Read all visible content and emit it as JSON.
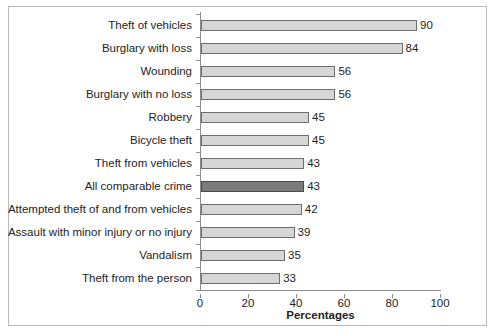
{
  "chart_data": {
    "type": "bar",
    "orientation": "horizontal",
    "title": "",
    "xlabel": "Percentages",
    "ylabel": "",
    "xlim": [
      0,
      100
    ],
    "xticks": [
      0,
      20,
      40,
      60,
      80,
      100
    ],
    "grid": false,
    "legend": null,
    "categories": [
      "Theft of vehicles",
      "Burglary with loss",
      "Wounding",
      "Burglary with no loss",
      "Robbery",
      "Bicycle theft",
      "Theft from vehicles",
      "All comparable crime",
      "Attempted theft of and from vehicles",
      "Assault with minor injury or no injury",
      "Vandalism",
      "Theft from the person"
    ],
    "values": [
      90,
      84,
      56,
      56,
      45,
      45,
      43,
      43,
      42,
      39,
      35,
      33
    ],
    "highlighted_category": "All comparable crime",
    "colors": {
      "bar_fill": "#d6d6d6",
      "bar_border": "#6e6e6e",
      "highlight_fill": "#7b7b7b",
      "highlight_border": "#4a4a4a",
      "axis": "#8d8d8d",
      "text": "#242424",
      "frame": "#b9b9b9",
      "background": "#ffffff"
    }
  }
}
